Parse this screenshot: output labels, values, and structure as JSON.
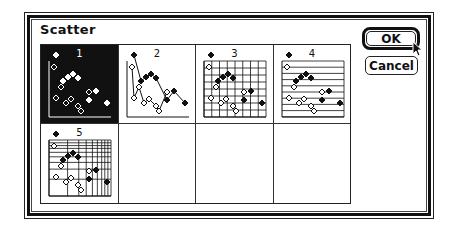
{
  "dialog": {
    "title": "Scatter",
    "buttons": {
      "ok": "OK",
      "cancel": "Cancel"
    }
  },
  "gallery": {
    "selected_index": 1,
    "cells": [
      {
        "label": "1",
        "style": "scatter-plain",
        "selected": true
      },
      {
        "label": "2",
        "style": "scatter-lines",
        "selected": false
      },
      {
        "label": "3",
        "style": "scatter-full-grid",
        "selected": false
      },
      {
        "label": "4",
        "style": "scatter-horizontal-grid",
        "selected": false
      },
      {
        "label": "5",
        "style": "scatter-log-grid",
        "selected": false
      },
      {
        "label": "",
        "style": "empty",
        "selected": false
      },
      {
        "label": "",
        "style": "empty",
        "selected": false
      },
      {
        "label": "",
        "style": "empty",
        "selected": false
      }
    ]
  },
  "thumbnail_points": {
    "filled": [
      [
        15,
        10
      ],
      [
        22,
        36
      ],
      [
        27,
        32
      ],
      [
        32,
        29
      ],
      [
        37,
        33
      ],
      [
        55,
        46
      ],
      [
        48,
        55
      ],
      [
        66,
        58
      ]
    ],
    "hollow": [
      [
        13,
        22
      ],
      [
        20,
        42
      ],
      [
        48,
        47
      ],
      [
        15,
        53
      ],
      [
        25,
        58
      ],
      [
        30,
        54
      ],
      [
        37,
        61
      ],
      [
        40,
        66
      ]
    ]
  },
  "icons": {
    "cursor": "arrow-pointer-icon"
  },
  "colors": {
    "ink": "#111111",
    "paper": "#ffffff"
  }
}
